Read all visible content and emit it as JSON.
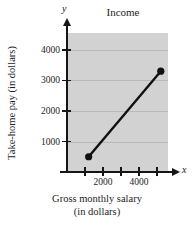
{
  "chart_data": {
    "type": "line",
    "title": "Income",
    "xlabel": "Gross monthly salary (in dollars)",
    "xlabel_line1": "Gross monthly salary",
    "xlabel_line2": "(in dollars)",
    "ylabel": "Take-home pay (in dollars)",
    "x_axis_variable": "x",
    "y_axis_variable": "y",
    "grid": true,
    "grid_orientation": "horizontal",
    "legend": "none",
    "xlim": [
      0,
      5600
    ],
    "ylim": [
      0,
      4550
    ],
    "x_ticks": [
      1000,
      2000,
      3000,
      4000,
      5000
    ],
    "x_tick_labels": [
      "",
      "2000",
      "",
      "4000",
      ""
    ],
    "y_ticks": [
      1000,
      2000,
      3000,
      4000
    ],
    "y_tick_labels": [
      "1000",
      "2000",
      "3000",
      "4000"
    ],
    "series": [
      {
        "name": "Take-home pay",
        "marker": "filled-circle",
        "color": "#101010",
        "x": [
          1200,
          5200
        ],
        "y": [
          500,
          3300
        ],
        "points": [
          {
            "x": 1200,
            "y": 500
          },
          {
            "x": 5200,
            "y": 3300
          }
        ]
      }
    ],
    "plot_background": "#d2d2d2",
    "page_background": "#ffffff"
  },
  "figure": {
    "title": "Income",
    "axis_variable_x": "x",
    "axis_variable_y": "y",
    "y_axis_title": "Take-home pay (in dollars)",
    "x_axis_title_line1": "Gross monthly salary",
    "x_axis_title_line2": "(in dollars)",
    "y_tick_labels": [
      "1000",
      "2000",
      "3000",
      "4000"
    ],
    "x_tick_labels": [
      "2000",
      "4000"
    ],
    "corner_mark": ""
  }
}
